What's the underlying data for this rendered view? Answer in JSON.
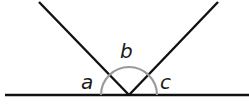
{
  "diagram": {
    "type": "angles-on-a-straight-line",
    "labels": {
      "a": "a",
      "b": "b",
      "c": "c"
    },
    "colors": {
      "lines": "#111111",
      "arc": "#9a9a9a",
      "text": "#1a1a1a"
    }
  }
}
